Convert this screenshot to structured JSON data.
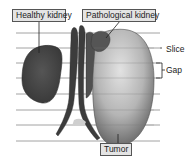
{
  "diagram": {
    "labels": {
      "healthy_kidney": "Healthy kidney",
      "pathological_kidney": "Pathological kidney",
      "slice": "Slice",
      "gap": "Gap",
      "tumor": "Tumor"
    },
    "slice_lines_y": [
      33,
      48,
      63,
      78,
      94,
      110,
      125,
      141
    ],
    "colors": {
      "background": "#ffffff",
      "label_fill": "#e4e4e4",
      "label_border": "#555555",
      "slice_line": "#8a8a8a",
      "healthy_kidney": "#4a4a4a",
      "tumor_light": "#d8d8d8",
      "tumor_dark": "#6a6a6a",
      "vessels": "#3c3c3c"
    }
  }
}
